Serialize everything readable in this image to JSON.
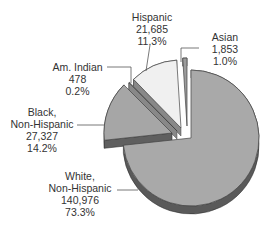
{
  "chart_data": {
    "type": "pie",
    "title": "",
    "style": "3d-exploded",
    "slices": [
      {
        "name": "White, Non-Hispanic",
        "label_lines": [
          "White,",
          "Non-Hispanic"
        ],
        "value": 140976,
        "value_label": "140,976",
        "percent": 73.3,
        "percent_label": "73.3%",
        "color": "#a9a9a9",
        "side": "#5a5a5a"
      },
      {
        "name": "Black, Non-Hispanic",
        "label_lines": [
          "Black,",
          "Non-Hispanic"
        ],
        "value": 27327,
        "value_label": "27,327",
        "percent": 14.2,
        "percent_label": "14.2%",
        "color": "#a6a6a6",
        "side": "#5f5f5f"
      },
      {
        "name": "Am. Indian",
        "label_lines": [
          "Am. Indian"
        ],
        "value": 478,
        "value_label": "478",
        "percent": 0.2,
        "percent_label": "0.2%",
        "color": "#b8b8b8",
        "side": "#6a6a6a"
      },
      {
        "name": "Hispanic",
        "label_lines": [
          "Hispanic"
        ],
        "value": 21685,
        "value_label": "21,685",
        "percent": 11.3,
        "percent_label": "11.3%",
        "color": "#f0f0f0",
        "side": "#9a9a9a"
      },
      {
        "name": "Asian",
        "label_lines": [
          "Asian"
        ],
        "value": 1853,
        "value_label": "1,853",
        "percent": 1.0,
        "percent_label": "1.0%",
        "color": "#9c9c9c",
        "side": "#555555"
      }
    ]
  }
}
